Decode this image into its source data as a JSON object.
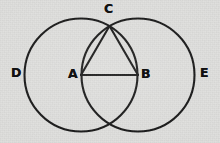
{
  "figure": {
    "kind": "geometry-diagram",
    "background_color": "#dededc",
    "stroke_color": "#111111",
    "stroke_width": 2.1,
    "canvas": {
      "width": 220,
      "height": 143
    }
  },
  "labels": [
    {
      "id": "D",
      "text": "D",
      "x": 11,
      "y": 67,
      "role": "left-circle-extremity"
    },
    {
      "id": "A",
      "text": "A",
      "x": 68,
      "y": 68,
      "role": "left-circle-center"
    },
    {
      "id": "C",
      "text": "C",
      "x": 104,
      "y": 3,
      "role": "upper-intersection"
    },
    {
      "id": "B",
      "text": "B",
      "x": 141,
      "y": 68,
      "role": "right-circle-center"
    },
    {
      "id": "E",
      "text": "E",
      "x": 200,
      "y": 67,
      "role": "right-circle-extremity"
    }
  ],
  "geometry": {
    "circles": [
      {
        "id": "left-circle",
        "cx": 81,
        "cy": 75,
        "r": 56.5
      },
      {
        "id": "right-circle",
        "cx": 138,
        "cy": 75,
        "r": 56.5
      }
    ],
    "points": {
      "A": {
        "x": 81,
        "y": 75
      },
      "B": {
        "x": 138,
        "y": 75
      },
      "C": {
        "x": 109.5,
        "y": 26
      },
      "D": {
        "x": 24.5,
        "y": 75
      },
      "E": {
        "x": 194.5,
        "y": 75
      },
      "lower_intersection": {
        "x": 109.5,
        "y": 124
      }
    },
    "segments": [
      {
        "id": "segment-AB",
        "from": "A",
        "to": "B"
      },
      {
        "id": "segment-AC",
        "from": "A",
        "to": "C"
      },
      {
        "id": "segment-BC",
        "from": "B",
        "to": "C"
      }
    ]
  }
}
